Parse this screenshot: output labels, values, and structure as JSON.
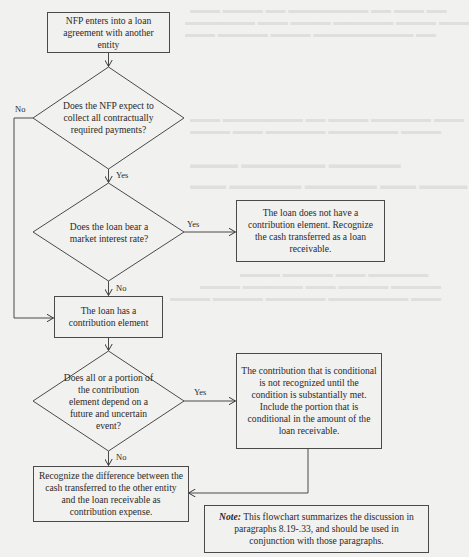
{
  "flowchart": {
    "start_box": {
      "text": "NFP enters into a loan agreement with another entity"
    },
    "decision_collect": {
      "text": "Does the NFP expect to collect all contractually required payments?",
      "yes_label": "Yes",
      "no_label": "No"
    },
    "decision_market_rate": {
      "text": "Does the loan bear a market interest rate?",
      "yes_label": "Yes",
      "no_label": "No"
    },
    "no_contribution_box": {
      "text": "The loan does not have a contribution element. Recognize the cash transferred as a loan receivable."
    },
    "has_contribution_box": {
      "text": "The loan has a contribution element"
    },
    "decision_conditional": {
      "text": "Does all or a portion of the contribution element depend on a future and uncertain event?",
      "yes_label": "Yes",
      "no_label": "No"
    },
    "conditional_box": {
      "text": "The contribution that is conditional is not recognized until the condition is substantially met. Include the portion that is conditional in the amount of the loan receivable."
    },
    "expense_box": {
      "text": "Recognize the difference between the cash transferred to the other entity and the loan receivable as contribution expense."
    },
    "note_box": {
      "label": "Note:",
      "text": " This flowchart summarizes the discussion in paragraphs 8.19-.33, and should be used in conjunction with those paragraphs."
    }
  },
  "colors": {
    "background": "#f1f1ef",
    "stroke": "#4a4a4a",
    "text": "#2a2a2a"
  }
}
